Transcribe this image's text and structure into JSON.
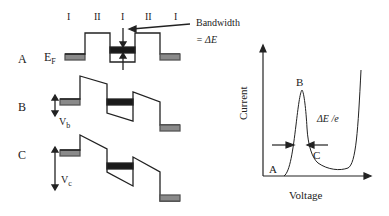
{
  "regions": [
    "I",
    "II",
    "I",
    "II",
    "I"
  ],
  "rows": [
    {
      "label": "A",
      "voltage_label": "E",
      "voltage_sub": "F"
    },
    {
      "label": "B",
      "voltage_label": "V",
      "voltage_sub": "b"
    },
    {
      "label": "C",
      "voltage_label": "V",
      "voltage_sub": "c"
    }
  ],
  "annotation": {
    "line1": "Bandwidth",
    "line2": "= ΔE"
  },
  "iv_plot": {
    "ylabel": "Current",
    "xlabel": "Voltage",
    "points": {
      "a": "A",
      "b": "B",
      "c": "C"
    },
    "width_label": "ΔE /e"
  },
  "colors": {
    "line": "#222222",
    "fermi_fill": "#8a8a8a",
    "band_fill": "#1a1a1a"
  }
}
